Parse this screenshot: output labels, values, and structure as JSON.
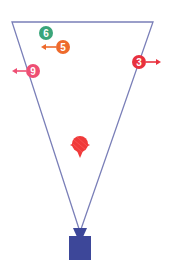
{
  "canvas": {
    "width": 170,
    "height": 276,
    "background": "#ffffff"
  },
  "field": {
    "shape": "inverted-triangle",
    "line_color": "#7a7fb8",
    "vertices": {
      "top_left": [
        12,
        22
      ],
      "top_right": [
        153,
        22
      ],
      "bottom": [
        80,
        232
      ]
    }
  },
  "post": {
    "color": "#3d4799",
    "cap": {
      "top_left": [
        73,
        228
      ],
      "top_right": [
        87,
        228
      ],
      "bottom_left": [
        77,
        236
      ],
      "bottom_right": [
        83,
        236
      ]
    },
    "body": {
      "x": 69,
      "y": 236,
      "width": 22,
      "height": 24
    }
  },
  "ball": {
    "x": 80,
    "y": 146,
    "color": "#f03a3a"
  },
  "players": [
    {
      "id": "6",
      "label": "6",
      "x": 46,
      "y": 33,
      "color": "#3aa57a",
      "arrow": null
    },
    {
      "id": "5",
      "label": "5",
      "x": 63,
      "y": 47,
      "color": "#ee6a2c",
      "arrow": "left"
    },
    {
      "id": "9",
      "label": "9",
      "x": 33,
      "y": 71,
      "color": "#ee4f74",
      "arrow": "left"
    },
    {
      "id": "3",
      "label": "3",
      "x": 139,
      "y": 62,
      "color": "#e8313e",
      "arrow": "right"
    }
  ]
}
